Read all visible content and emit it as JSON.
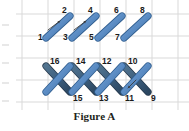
{
  "figure": {
    "caption": "Figure A",
    "colors": {
      "grid": "#d9d9d9",
      "stroke_light": "#5b8cc4",
      "stroke_light_edge": "#2f5d8f",
      "stroke_dark": "#3e5f7e",
      "stroke_dark_edge": "#26394d",
      "label": "#1a1a1a",
      "background": "#ffffff",
      "arrow": "#3a3a3a"
    },
    "grid": {
      "vertical_x": [
        22,
        48,
        74,
        100,
        126,
        152,
        178
      ],
      "horizontal_y": [
        14,
        36,
        58,
        80,
        102
      ],
      "show": true
    },
    "top_row": {
      "description": "four parallel rising diagonal strokes",
      "strokes": [
        {
          "id": "s1",
          "x1": 46,
          "y1": 38,
          "x2": 70,
          "y2": 16,
          "color": "light",
          "start_label": "1",
          "end_label": "2"
        },
        {
          "id": "s2",
          "x1": 72,
          "y1": 38,
          "x2": 96,
          "y2": 16,
          "color": "light",
          "start_label": "3",
          "end_label": "4"
        },
        {
          "id": "s3",
          "x1": 98,
          "y1": 38,
          "x2": 122,
          "y2": 16,
          "color": "light",
          "start_label": "5",
          "end_label": "6"
        },
        {
          "id": "s4",
          "x1": 124,
          "y1": 38,
          "x2": 148,
          "y2": 16,
          "color": "light",
          "start_label": "7",
          "end_label": "8"
        }
      ],
      "labels_top": [
        "2",
        "4",
        "6",
        "8"
      ],
      "labels_bottom": [
        "1",
        "3",
        "5",
        "7"
      ]
    },
    "bottom_row": {
      "description": "zigzag lattice of crossing strokes",
      "strokes": [
        {
          "id": "s16",
          "x1": 46,
          "y1": 66,
          "x2": 70,
          "y2": 92,
          "color": "dark",
          "start_label": "16",
          "end_label": "15"
        },
        {
          "id": "s15",
          "x1": 46,
          "y1": 92,
          "x2": 70,
          "y2": 66,
          "color": "light",
          "start_label": "15",
          "end_label": "16"
        },
        {
          "id": "s14",
          "x1": 72,
          "y1": 66,
          "x2": 96,
          "y2": 92,
          "color": "dark",
          "start_label": "14",
          "end_label": "13"
        },
        {
          "id": "s13",
          "x1": 72,
          "y1": 92,
          "x2": 96,
          "y2": 66,
          "color": "light",
          "start_label": "13",
          "end_label": "14"
        },
        {
          "id": "s12",
          "x1": 98,
          "y1": 66,
          "x2": 122,
          "y2": 92,
          "color": "dark",
          "start_label": "12",
          "end_label": "11"
        },
        {
          "id": "s11",
          "x1": 98,
          "y1": 92,
          "x2": 122,
          "y2": 66,
          "color": "light",
          "start_label": "11",
          "end_label": "12"
        },
        {
          "id": "s10",
          "x1": 124,
          "y1": 66,
          "x2": 148,
          "y2": 92,
          "color": "dark",
          "start_label": "10",
          "end_label": "9"
        },
        {
          "id": "s9",
          "x1": 124,
          "y1": 92,
          "x2": 148,
          "y2": 66,
          "color": "light",
          "start_label": "9",
          "end_label": "10"
        }
      ],
      "labels_top": [
        "16",
        "14",
        "12",
        "10"
      ],
      "labels_bottom": [
        "15",
        "13",
        "11",
        "9"
      ]
    },
    "direction_arrows": [
      {
        "id": "a1",
        "x1": 48,
        "y1": 30,
        "x2": 60,
        "y2": 21
      },
      {
        "id": "a2",
        "x1": 74,
        "y1": 30,
        "x2": 86,
        "y2": 21
      },
      {
        "id": "a3",
        "x1": 136,
        "y1": 80,
        "x2": 128,
        "y2": 88
      }
    ],
    "labels": [
      {
        "text": "2",
        "x": 62,
        "y": 6,
        "name": "label-2"
      },
      {
        "text": "4",
        "x": 88,
        "y": 6,
        "name": "label-4"
      },
      {
        "text": "6",
        "x": 114,
        "y": 6,
        "name": "label-6"
      },
      {
        "text": "8",
        "x": 140,
        "y": 6,
        "name": "label-8"
      },
      {
        "text": "1",
        "x": 38,
        "y": 33,
        "name": "label-1"
      },
      {
        "text": "3",
        "x": 63,
        "y": 33,
        "name": "label-3"
      },
      {
        "text": "5",
        "x": 89,
        "y": 33,
        "name": "label-5"
      },
      {
        "text": "7",
        "x": 115,
        "y": 33,
        "name": "label-7"
      },
      {
        "text": "16",
        "x": 50,
        "y": 57,
        "name": "label-16"
      },
      {
        "text": "14",
        "x": 76,
        "y": 57,
        "name": "label-14"
      },
      {
        "text": "12",
        "x": 102,
        "y": 57,
        "name": "label-12"
      },
      {
        "text": "10",
        "x": 128,
        "y": 57,
        "name": "label-10"
      },
      {
        "text": "15",
        "x": 73,
        "y": 94,
        "name": "label-15"
      },
      {
        "text": "13",
        "x": 99,
        "y": 94,
        "name": "label-13"
      },
      {
        "text": "11",
        "x": 125,
        "y": 94,
        "name": "label-11"
      },
      {
        "text": "9",
        "x": 151,
        "y": 94,
        "name": "label-9"
      }
    ],
    "edge_marks_y": [
      24,
      44,
      62,
      82,
      100
    ]
  }
}
